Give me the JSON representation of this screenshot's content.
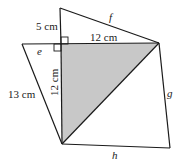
{
  "diagram": {
    "type": "geometry",
    "labels": {
      "top_vertical": "5 cm",
      "horizontal": "12 cm",
      "vertical": "12 cm",
      "hypotenuse_left": "13 cm",
      "e": "e",
      "f": "f",
      "g": "g",
      "h": "h"
    },
    "colors": {
      "stroke": "#1a1a1a",
      "shaded": "#c8c8c8",
      "background": "#ffffff"
    }
  }
}
